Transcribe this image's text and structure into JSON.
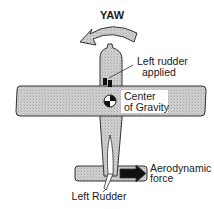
{
  "diagram": {
    "title": "YAW",
    "labels": {
      "left_rudder_applied_line1": "Left rudder",
      "left_rudder_applied_line2": "applied",
      "center_of_gravity_line1": "Center",
      "center_of_gravity_line2": "of Gravity",
      "aerodynamic_force_line1": "Aerodynamic",
      "aerodynamic_force_line2": "force",
      "left_rudder": "Left Rudder"
    },
    "icons": {
      "yaw_arrow": "curved-arrow-left-icon",
      "cg_symbol": "center-of-gravity-icon",
      "force_arrow": "arrow-right-icon",
      "rudder_pedals": "rudder-pedal-icon"
    },
    "colors": {
      "aircraft_fill": "#c8c8c8",
      "outline": "#333333",
      "black": "#111111",
      "background": "#ffffff"
    }
  }
}
